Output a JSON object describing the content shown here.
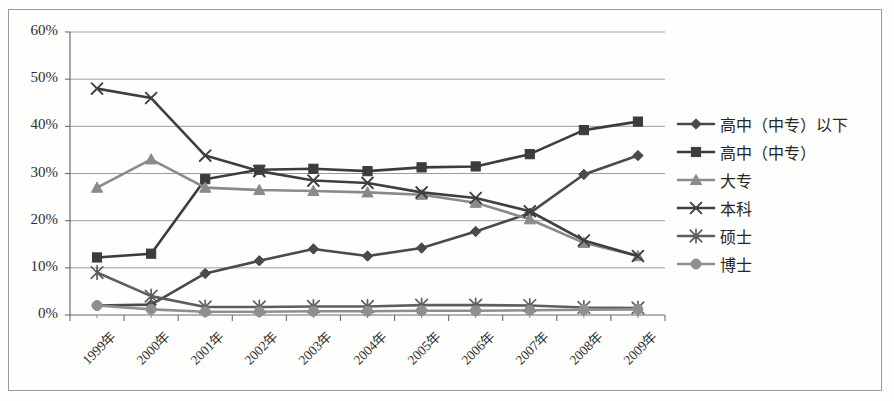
{
  "chart_data": {
    "type": "line",
    "title": "",
    "xlabel": "",
    "ylabel": "",
    "categories": [
      "1999年",
      "2000年",
      "2001年",
      "2002年",
      "2003年",
      "2004年",
      "2005年",
      "2006年",
      "2007年",
      "2008年",
      "2009年"
    ],
    "ylim": [
      0,
      60
    ],
    "ytick_labels": [
      "0%",
      "10%",
      "20%",
      "30%",
      "40%",
      "50%",
      "60%"
    ],
    "ytick_values": [
      0,
      10,
      20,
      30,
      40,
      50,
      60
    ],
    "grid": true,
    "legend_position": "right",
    "value_suffix": "%",
    "series": [
      {
        "name": "高中（中专）以下",
        "marker": "diamond",
        "color": "#4a4a4a",
        "values": [
          2.0,
          2.2,
          8.8,
          11.5,
          14.0,
          12.5,
          14.2,
          17.7,
          21.6,
          29.8,
          33.8
        ]
      },
      {
        "name": "高中（中专）",
        "marker": "square",
        "color": "#3c3c3c",
        "values": [
          12.2,
          13.0,
          28.8,
          30.8,
          31.0,
          30.5,
          31.3,
          31.5,
          34.1,
          39.2,
          41.0
        ]
      },
      {
        "name": "大专",
        "marker": "triangle",
        "color": "#8a8a8a",
        "values": [
          27.0,
          33.0,
          27.0,
          26.5,
          26.3,
          26.0,
          25.5,
          23.8,
          20.3,
          15.3,
          12.5
        ]
      },
      {
        "name": "本科",
        "marker": "x",
        "color": "#3f3f3f",
        "values": [
          48.0,
          46.0,
          33.8,
          30.5,
          28.5,
          28.0,
          26.0,
          24.8,
          22.0,
          15.8,
          12.5
        ]
      },
      {
        "name": "硕士",
        "marker": "asterisk",
        "color": "#5e5e5e",
        "values": [
          9.0,
          4.0,
          1.7,
          1.7,
          1.8,
          1.8,
          2.1,
          2.1,
          2.0,
          1.6,
          1.5
        ]
      },
      {
        "name": "博士",
        "marker": "circle",
        "color": "#8f8f8f",
        "values": [
          2.0,
          1.2,
          0.7,
          0.7,
          0.8,
          0.8,
          0.9,
          0.9,
          1.0,
          1.1,
          1.2
        ]
      }
    ]
  },
  "legend": {
    "items": [
      {
        "label": "高中（中专）以下"
      },
      {
        "label": "高中（中专）"
      },
      {
        "label": "大专"
      },
      {
        "label": "本科"
      },
      {
        "label": "硕士"
      },
      {
        "label": "博士"
      }
    ]
  }
}
